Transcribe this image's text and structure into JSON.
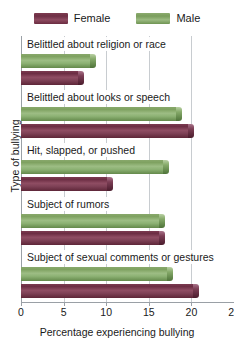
{
  "legend": {
    "entries": [
      {
        "label": "Female",
        "color": "#6e2f45",
        "icon": "legend-swatch-female"
      },
      {
        "label": "Male",
        "color": "#7a9d5c",
        "icon": "legend-swatch-male"
      }
    ]
  },
  "axes": {
    "xlabel": "Percentage experiencing bullying",
    "ylabel": "Type of bullying",
    "xticks": [
      "0",
      "5",
      "10",
      "15",
      "20",
      "25"
    ]
  },
  "chart_data": {
    "type": "bar",
    "orientation": "horizontal",
    "title": "",
    "xlabel": "Percentage experiencing bullying",
    "ylabel": "Type of bullying",
    "xlim": [
      0,
      25
    ],
    "xticks": [
      0,
      5,
      10,
      15,
      20,
      25
    ],
    "grid": true,
    "legend_position": "top-center",
    "categories": [
      "Belittled about religion or race",
      "Belittled about looks or speech",
      "Hit, slapped, or pushed",
      "Subject of rumors",
      "Subject of sexual comments or gestures"
    ],
    "series": [
      {
        "name": "Male",
        "color": "#7a9d5c",
        "values": [
          8.5,
          18.5,
          17.0,
          16.5,
          17.5
        ]
      },
      {
        "name": "Female",
        "color": "#6e2f45",
        "values": [
          7.0,
          20.0,
          10.5,
          16.5,
          20.5
        ]
      }
    ]
  }
}
